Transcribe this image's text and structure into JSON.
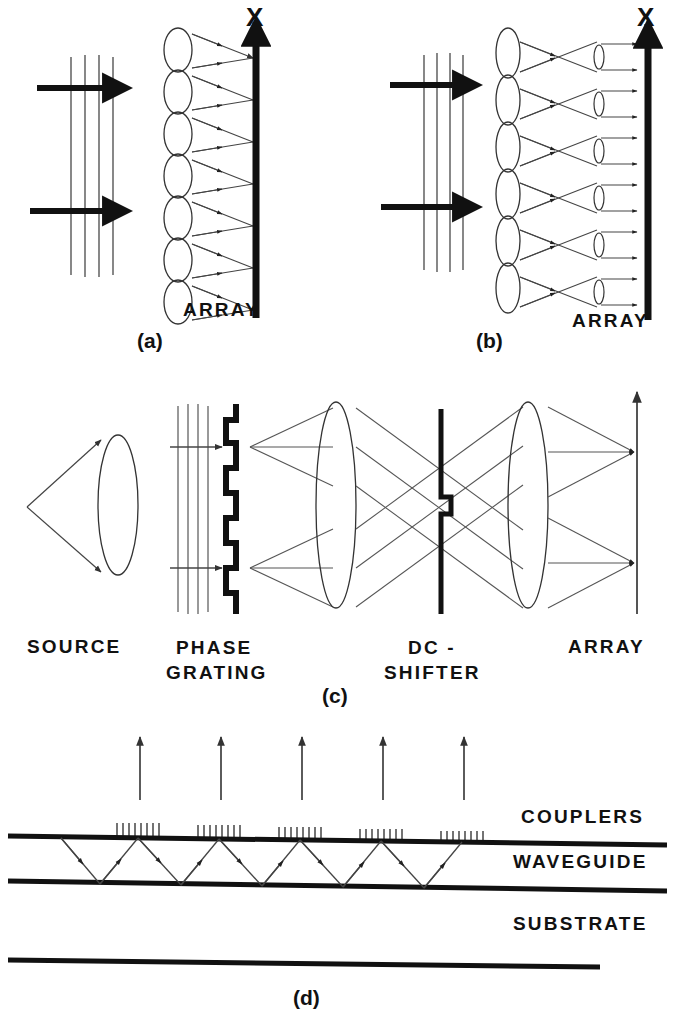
{
  "figure": {
    "title_visible": false,
    "panels": [
      {
        "id": "a",
        "caption": "(a)",
        "axis_label": "X",
        "array_label": "ARRAY",
        "lenslet_count": 7,
        "input_beam_arrows": 2,
        "wavefront_lines": 4,
        "description": "Lenslet array each focusing a fan of rays to a single point on the X output axis"
      },
      {
        "id": "b",
        "caption": "(b)",
        "axis_label": "X",
        "array_label": "ARRAY",
        "lenslet_count": 6,
        "secondary_lens_count": 6,
        "input_beam_arrows": 2,
        "wavefront_lines": 4,
        "description": "Lenslet array with crossing rays through secondary micro-lenses producing collimated output pairs"
      },
      {
        "id": "c",
        "caption": "(c)",
        "component_labels": [
          "SOURCE",
          "PHASE GRATING",
          "DC - SHIFTER",
          "ARRAY"
        ],
        "source_label": "SOURCE",
        "phase_label_line1": "PHASE",
        "phase_label_line2": "GRATING",
        "dc_label_line1": "DC -",
        "dc_label_line2": "SHIFTER",
        "array_label": "ARRAY",
        "grating_steps": 8,
        "description": "Source lens, binary phase grating, two imaging lenses, DC-shifter plate with central step, and output array axis"
      },
      {
        "id": "d",
        "caption": "(d)",
        "labels": [
          "COUPLERS",
          "WAVEGUIDE",
          "SUBSTRATE"
        ],
        "couplers_label": "COUPLERS",
        "waveguide_label": "WAVEGUIDE",
        "substrate_label": "SUBSTRATE",
        "coupler_count": 5,
        "coupler_teeth_each": 8,
        "output_arrow_count": 5,
        "description": "Planar waveguide with zig-zag guided ray and five grating out-couplers emitting upward beams above a substrate"
      }
    ]
  },
  "colors": {
    "ink": "#111111",
    "thin_ray": "#555555",
    "background": "#ffffff"
  }
}
